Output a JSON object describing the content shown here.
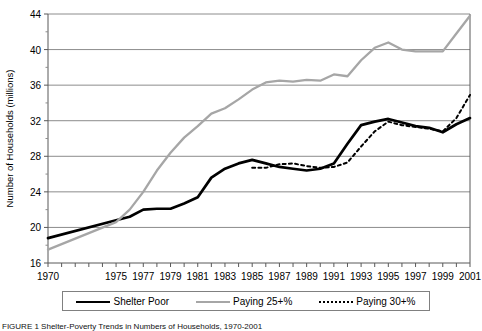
{
  "figure": {
    "caption": "FIGURE 1   Shelter-Poverty Trends in Numbers of Households, 1970-2001"
  },
  "legend": {
    "items": [
      {
        "label": "Shelter Poor",
        "style": "solid-black",
        "color": "#000000"
      },
      {
        "label": "Paying 25+%",
        "style": "solid-gray",
        "color": "#a6a6a6"
      },
      {
        "label": "Paying 30+%",
        "style": "dotted-black",
        "color": "#000000"
      }
    ]
  },
  "chart_data": {
    "type": "line",
    "title": "",
    "xlabel": "",
    "ylabel": "Number of Households (millions)",
    "ylim": [
      16,
      44
    ],
    "yticks": [
      16,
      20,
      24,
      28,
      32,
      36,
      40,
      44
    ],
    "grid": true,
    "legend_position": "bottom",
    "x": [
      1970,
      1975,
      1977,
      1979,
      1981,
      1983,
      1985,
      1987,
      1989,
      1991,
      1993,
      1995,
      1997,
      1999,
      2001
    ],
    "tick_labels": [
      "1970",
      "1975",
      "1977",
      "1979",
      "1981",
      "1983",
      "1985",
      "1987",
      "1989",
      "1991",
      "1993",
      "1995",
      "1997",
      "1999",
      "2001"
    ],
    "series": [
      {
        "name": "Shelter Poor",
        "color": "#000000",
        "style": "solid",
        "x": [
          1970,
          1975,
          1976,
          1977,
          1978,
          1979,
          1980,
          1981,
          1982,
          1983,
          1984,
          1985,
          1986,
          1987,
          1988,
          1989,
          1990,
          1991,
          1992,
          1993,
          1994,
          1995,
          1996,
          1997,
          1998,
          1999,
          2000,
          2001
        ],
        "values": [
          18.8,
          20.8,
          21.2,
          22.0,
          22.1,
          22.1,
          22.7,
          23.4,
          25.6,
          26.6,
          27.2,
          27.6,
          27.2,
          26.8,
          26.6,
          26.4,
          26.6,
          27.2,
          29.4,
          31.5,
          31.9,
          32.2,
          31.8,
          31.4,
          31.2,
          30.7,
          31.6,
          32.3
        ]
      },
      {
        "name": "Paying 25+%",
        "color": "#a6a6a6",
        "style": "solid",
        "x": [
          1970,
          1975,
          1976,
          1977,
          1978,
          1979,
          1980,
          1981,
          1982,
          1983,
          1984,
          1985,
          1986,
          1987,
          1988,
          1989,
          1990,
          1991,
          1992,
          1993,
          1994,
          1995,
          1996,
          1997,
          1998,
          1999,
          2000,
          2001
        ],
        "values": [
          17.5,
          20.6,
          22.0,
          24.0,
          26.4,
          28.4,
          30.1,
          31.4,
          32.8,
          33.4,
          34.4,
          35.5,
          36.3,
          36.5,
          36.4,
          36.6,
          36.5,
          37.2,
          37.0,
          38.8,
          40.2,
          40.8,
          40.0,
          39.8,
          39.8,
          39.8,
          41.8,
          43.8
        ]
      },
      {
        "name": "Paying 30+%",
        "color": "#000000",
        "style": "dotted",
        "x": [
          1985,
          1986,
          1987,
          1988,
          1989,
          1990,
          1991,
          1992,
          1993,
          1994,
          1995,
          1996,
          1997,
          1998,
          1999,
          2000,
          2001
        ],
        "values": [
          26.7,
          26.7,
          27.1,
          27.2,
          26.9,
          26.7,
          26.8,
          27.3,
          29.1,
          30.8,
          31.9,
          31.5,
          31.3,
          31.1,
          30.8,
          32.3,
          34.9
        ]
      }
    ]
  }
}
